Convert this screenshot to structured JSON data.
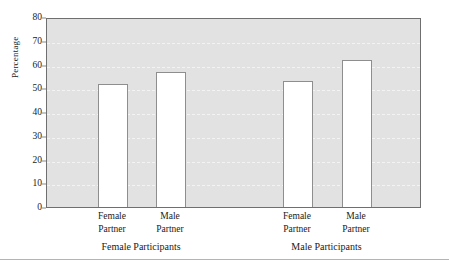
{
  "chart_data": {
    "type": "bar",
    "title": "",
    "subtitle": "",
    "xlabel": "",
    "ylabel": "Percentage",
    "ylim": [
      0,
      80
    ],
    "yticks": [
      0,
      10,
      20,
      30,
      40,
      50,
      60,
      70,
      80
    ],
    "grid": "horizontal-dashed",
    "legend": "none",
    "categories": [
      "Female Partner",
      "Male Partner",
      "Female Partner",
      "Male Partner"
    ],
    "values": [
      52,
      57,
      53,
      62
    ],
    "groups": [
      {
        "label": "Female Participants",
        "categories": [
          "Female Partner",
          "Male Partner"
        ],
        "values": [
          52,
          57
        ]
      },
      {
        "label": "Male Participants",
        "categories": [
          "Female Partner",
          "Male Partner"
        ],
        "values": [
          53,
          62
        ]
      }
    ],
    "bar_style": {
      "fill": "#ffffff",
      "edge": "#8e8e8e"
    },
    "plot_background": "#e2e2e2"
  },
  "axis": {
    "y": {
      "title": "Percentage",
      "ticks": [
        {
          "label": "80",
          "value": 80
        },
        {
          "label": "70",
          "value": 70
        },
        {
          "label": "60",
          "value": 60
        },
        {
          "label": "50",
          "value": 50
        },
        {
          "label": "40",
          "value": 40
        },
        {
          "label": "30",
          "value": 30
        },
        {
          "label": "20",
          "value": 20
        },
        {
          "label": "10",
          "value": 10
        },
        {
          "label": "0",
          "value": 0
        }
      ]
    },
    "x": {
      "ticks": [
        {
          "line1": "Female",
          "line2": "Partner"
        },
        {
          "line1": "Male",
          "line2": "Partner"
        },
        {
          "line1": "Female",
          "line2": "Partner"
        },
        {
          "line1": "Male",
          "line2": "Partner"
        }
      ],
      "groups": [
        {
          "label": "Female Participants"
        },
        {
          "label": "Male Participants"
        }
      ]
    }
  }
}
